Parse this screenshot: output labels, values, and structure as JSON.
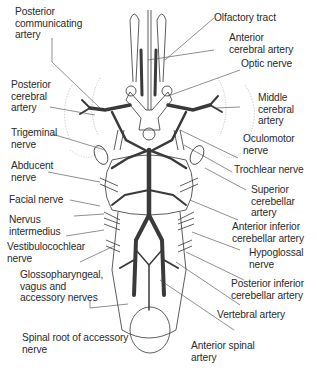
{
  "diagram": {
    "title": "",
    "colors": {
      "artery": "#3a3a3a",
      "outline": "#333333",
      "label_text": "#2a2a2a",
      "leader": "#444444",
      "background": "#ffffff"
    },
    "labels_left": [
      {
        "id": "posterior-communicating-artery",
        "lines": [
          "Posterior",
          "communicating",
          "artery"
        ]
      },
      {
        "id": "posterior-cerebral-artery",
        "lines": [
          "Posterior",
          "cerebral",
          "artery"
        ]
      },
      {
        "id": "trigeminal-nerve",
        "lines": [
          "Trigeminal",
          "nerve"
        ]
      },
      {
        "id": "abducent-nerve",
        "lines": [
          "Abducent",
          "nerve"
        ]
      },
      {
        "id": "facial-nerve",
        "lines": [
          "Facial nerve"
        ]
      },
      {
        "id": "nervus-intermedius",
        "lines": [
          "Nervus",
          "intermedius"
        ]
      },
      {
        "id": "vestibulocochlear-nerve",
        "lines": [
          "Vestibulocochlear",
          "nerve"
        ]
      },
      {
        "id": "glossopharyngeal-vagus-accessory",
        "lines": [
          "Glossopharyngeal,",
          "vagus and",
          "accessory nerves"
        ]
      },
      {
        "id": "spinal-root-accessory-nerve",
        "lines": [
          "Spinal root of accessory",
          "nerve"
        ]
      }
    ],
    "labels_right": [
      {
        "id": "olfactory-tract",
        "lines": [
          "Olfactory tract"
        ]
      },
      {
        "id": "anterior-cerebral-artery",
        "lines": [
          "Anterior",
          "cerebral artery"
        ]
      },
      {
        "id": "optic-nerve",
        "lines": [
          "Optic nerve"
        ]
      },
      {
        "id": "middle-cerebral-artery",
        "lines": [
          "Middle",
          "cerebral",
          "artery"
        ]
      },
      {
        "id": "oculomotor-nerve",
        "lines": [
          "Oculomotor",
          "nerve"
        ]
      },
      {
        "id": "trochlear-nerve",
        "lines": [
          "Trochlear nerve"
        ]
      },
      {
        "id": "superior-cerebellar-artery",
        "lines": [
          "Superior",
          "cerebellar",
          "artery"
        ]
      },
      {
        "id": "anterior-inferior-cerebellar-artery",
        "lines": [
          "Anterior inferior",
          "cerebellar artery"
        ]
      },
      {
        "id": "hypoglossal-nerve",
        "lines": [
          "Hypoglossal",
          "nerve"
        ]
      },
      {
        "id": "posterior-inferior-cerebellar-artery",
        "lines": [
          "Posterior inferior",
          "cerebellar artery"
        ]
      },
      {
        "id": "vertebral-artery",
        "lines": [
          "Vertebral artery"
        ]
      },
      {
        "id": "anterior-spinal-artery",
        "lines": [
          "Anterior spinal",
          "artery"
        ]
      }
    ]
  }
}
